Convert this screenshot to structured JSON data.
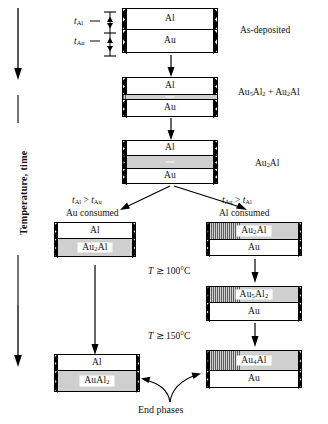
{
  "axis": {
    "label": "Temperature, time"
  },
  "thickness_markers": {
    "al": {
      "symbol": "t",
      "subscript": "Al"
    },
    "au": {
      "symbol": "t",
      "subscript": "Au"
    }
  },
  "stages": [
    {
      "id": "as-deposited",
      "side_label": "As-deposited",
      "layers": [
        {
          "name": "Al",
          "style": "white"
        },
        {
          "name": "Au",
          "style": "white"
        }
      ]
    },
    {
      "id": "first-compounds",
      "side_label_parts": [
        "Au",
        "5",
        "Al",
        "2",
        " + Au",
        "2",
        "Al"
      ],
      "side_label": "Au5Al2 + Au2Al",
      "layers": [
        {
          "name": "Al",
          "style": "white"
        },
        {
          "name": "",
          "style": "hatch"
        },
        {
          "name": "Au",
          "style": "white"
        }
      ]
    },
    {
      "id": "au2al-stage",
      "side_label": "Au2Al",
      "layers": [
        {
          "name": "Al",
          "style": "white"
        },
        {
          "name": "",
          "style": "hatch"
        },
        {
          "name": "Au",
          "style": "white"
        }
      ]
    }
  ],
  "branches": {
    "left": {
      "condition": "tAl > tAu",
      "condition_parts": {
        "lhs_sub": "Al",
        "op": ">",
        "rhs_sub": "Au"
      },
      "consumed": "Au consumed",
      "stacks": [
        {
          "id": "left-au2al",
          "layers": [
            {
              "name": "Al",
              "style": "white"
            },
            {
              "name": "Au2Al",
              "style": "hatch"
            }
          ]
        },
        {
          "id": "left-end-aual2",
          "layers": [
            {
              "name": "Al",
              "style": "white"
            },
            {
              "name": "AuAl2",
              "style": "hatch"
            }
          ]
        }
      ]
    },
    "right": {
      "condition": "tAu > tAl",
      "condition_parts": {
        "lhs_sub": "Au",
        "op": ">",
        "rhs_sub": "Al"
      },
      "consumed": "Al consumed",
      "stacks": [
        {
          "id": "right-au2al",
          "layers": [
            {
              "name": "Au2Al",
              "style": "hatch"
            },
            {
              "name": "Au",
              "style": "white"
            }
          ]
        },
        {
          "id": "right-au5al2",
          "layers": [
            {
              "name": "Au5Al2",
              "style": "hatch"
            },
            {
              "name": "Au",
              "style": "white"
            }
          ]
        },
        {
          "id": "right-end-au4al",
          "layers": [
            {
              "name": "Au4Al",
              "style": "hatch"
            },
            {
              "name": "Au",
              "style": "white"
            }
          ]
        }
      ]
    }
  },
  "conditions": {
    "t100": {
      "symbol": "T",
      "relation": "≳",
      "value": "100°C"
    },
    "t150": {
      "symbol": "T",
      "relation": "≳",
      "value": "150°C"
    }
  },
  "end_phases_label": "End phases",
  "colors": {
    "ink": "#111111",
    "hatch_fill": "#cfcfcf",
    "background": "#ffffff"
  }
}
